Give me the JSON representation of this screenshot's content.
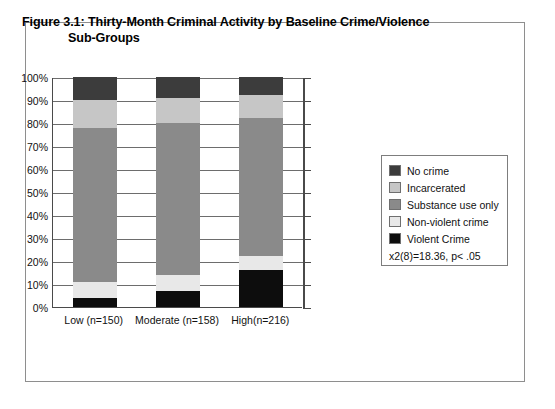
{
  "figure": {
    "title_line1": "Figure 3.1: Thirty-Month Criminal Activity by Baseline Crime/Violence",
    "title_line2": "Sub-Groups"
  },
  "legend": {
    "stat_annotation": "x2(8)=18.36, p< .05",
    "items": [
      {
        "label": "No crime",
        "color": "#3c3c3c"
      },
      {
        "label": "Incarcerated",
        "color": "#c6c6c6"
      },
      {
        "label": "Substance use only",
        "color": "#8a8a8a"
      },
      {
        "label": "Non-violent crime",
        "color": "#e8e8e8"
      },
      {
        "label": "Violent Crime",
        "color": "#0d0d0d"
      }
    ]
  },
  "chart_data": {
    "type": "bar",
    "subtype": "stacked-100-percent",
    "title": "Figure 3.1: Thirty-Month Criminal Activity by Baseline Crime/Violence Sub-Groups",
    "xlabel": "",
    "ylabel": "",
    "ylim": [
      0,
      100
    ],
    "ytick_labels": [
      "0%",
      "10%",
      "20%",
      "30%",
      "40%",
      "50%",
      "60%",
      "70%",
      "80%",
      "90%",
      "100%"
    ],
    "ytick_values": [
      0,
      10,
      20,
      30,
      40,
      50,
      60,
      70,
      80,
      90,
      100
    ],
    "grid": true,
    "legend_position": "right",
    "categories": [
      "Low (n=150)",
      "Moderate (n=158)",
      "High(n=216)"
    ],
    "series": [
      {
        "name": "Violent Crime",
        "color": "#0d0d0d",
        "values": [
          4,
          7,
          16
        ]
      },
      {
        "name": "Non-violent crime",
        "color": "#e8e8e8",
        "values": [
          7,
          7,
          6
        ]
      },
      {
        "name": "Substance use only",
        "color": "#8a8a8a",
        "values": [
          67,
          66,
          60
        ]
      },
      {
        "name": "Incarcerated",
        "color": "#c6c6c6",
        "values": [
          12,
          11,
          10
        ]
      },
      {
        "name": "No crime",
        "color": "#3c3c3c",
        "values": [
          10,
          9,
          8
        ]
      }
    ],
    "annotations": [
      "x2(8)=18.36, p< .05"
    ]
  }
}
